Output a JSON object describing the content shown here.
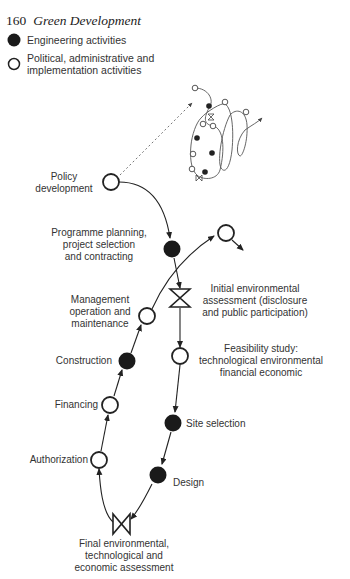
{
  "header": {
    "page_number": "160",
    "book_title": "Green Development"
  },
  "legend": [
    {
      "symbol": "filled-circle",
      "label": "Engineering activities"
    },
    {
      "symbol": "open-circle",
      "label_line1": "Political, administrative and",
      "label_line2": "implementation activities"
    }
  ],
  "nodes": {
    "policy": {
      "symbol": "open-circle",
      "line1": "Policy",
      "line2": "development"
    },
    "programme": {
      "symbol": "filled-circle",
      "line1": "Programme planning,",
      "line2": "project selection",
      "line3": "and contracting"
    },
    "initial_assessment": {
      "symbol": "bowtie",
      "line1": "Initial environmental",
      "line2": "assessment (disclosure",
      "line3": "and public participation)"
    },
    "feasibility": {
      "symbol": "open-circle",
      "line1": "Feasibility study:",
      "line2": "technological environmental",
      "line3": "financial economic"
    },
    "site_selection": {
      "symbol": "filled-circle",
      "line1": "Site selection"
    },
    "design": {
      "symbol": "filled-circle",
      "line1": "Design"
    },
    "final_assessment": {
      "symbol": "bowtie",
      "line1": "Final environmental,",
      "line2": "technological and",
      "line3": "economic assessment"
    },
    "authorization": {
      "symbol": "open-circle",
      "line1": "Authorization"
    },
    "financing": {
      "symbol": "open-circle",
      "line1": "Financing"
    },
    "construction": {
      "symbol": "filled-circle",
      "line1": "Construction"
    },
    "management": {
      "symbol": "open-circle",
      "line1": "Management",
      "line2": "operation and",
      "line3": "maintenance"
    },
    "next_cycle": {
      "symbol": "open-circle"
    }
  },
  "inset": {
    "description": "spiral of repeated project cycles"
  },
  "colors": {
    "ink": "#222222",
    "label": "#333333",
    "background": "#ffffff"
  }
}
